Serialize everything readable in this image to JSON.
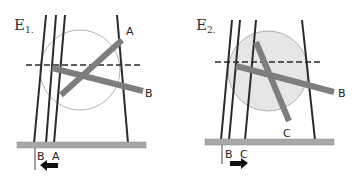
{
  "panels": [
    {
      "id": "E1",
      "title": "E",
      "subscript": "1.",
      "bar_labels": [
        "A",
        "B"
      ],
      "base_labels": [
        "B",
        "A"
      ],
      "arrow_direction": "left",
      "circle_fill": "none"
    },
    {
      "id": "E2",
      "title": "E",
      "subscript": "2.",
      "bar_labels": [
        "B",
        "C"
      ],
      "base_labels": [
        "B",
        "C"
      ],
      "arrow_direction": "right",
      "circle_fill": "#e6e6e6"
    }
  ],
  "colors": {
    "line": "#2a2a2a",
    "bar": "#8a8a8a",
    "base": "#a8a8a8",
    "circle_stroke": "#b0b0b0"
  }
}
